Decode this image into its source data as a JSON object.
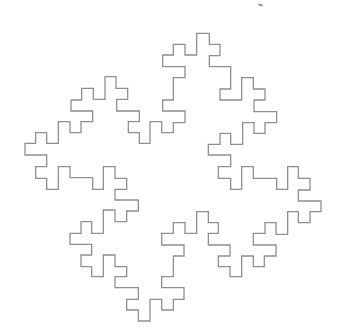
{
  "figure": {
    "stroke_color": "#8f8f8f",
    "stroke_width": 1.3,
    "background": "#ffffff",
    "scale_divisor": 3,
    "points": [
      [
        592,
        100
      ],
      [
        628,
        100
      ],
      [
        628,
        133
      ],
      [
        660,
        133
      ],
      [
        660,
        167
      ],
      [
        628,
        167
      ],
      [
        628,
        200
      ],
      [
        692,
        200
      ],
      [
        692,
        267
      ],
      [
        660,
        267
      ],
      [
        660,
        300
      ],
      [
        725,
        300
      ],
      [
        725,
        233
      ],
      [
        760,
        233
      ],
      [
        760,
        267
      ],
      [
        795,
        267
      ],
      [
        795,
        300
      ],
      [
        762,
        300
      ],
      [
        762,
        335
      ],
      [
        830,
        335
      ],
      [
        830,
        368
      ],
      [
        795,
        368
      ],
      [
        795,
        400
      ],
      [
        762,
        400
      ],
      [
        762,
        368
      ],
      [
        728,
        368
      ],
      [
        728,
        433
      ],
      [
        692,
        433
      ],
      [
        692,
        400
      ],
      [
        660,
        400
      ],
      [
        660,
        433
      ],
      [
        625,
        433
      ],
      [
        625,
        465
      ],
      [
        692,
        465
      ],
      [
        692,
        500
      ],
      [
        655,
        500
      ],
      [
        655,
        535
      ],
      [
        692,
        535
      ],
      [
        692,
        568
      ],
      [
        725,
        568
      ],
      [
        725,
        500
      ],
      [
        760,
        500
      ],
      [
        760,
        535
      ],
      [
        830,
        535
      ],
      [
        830,
        568
      ],
      [
        863,
        568
      ],
      [
        863,
        500
      ],
      [
        895,
        500
      ],
      [
        895,
        535
      ],
      [
        930,
        535
      ],
      [
        930,
        570
      ],
      [
        895,
        570
      ],
      [
        895,
        603
      ],
      [
        963,
        603
      ],
      [
        963,
        635
      ],
      [
        930,
        635
      ],
      [
        930,
        668
      ],
      [
        895,
        668
      ],
      [
        895,
        635
      ],
      [
        863,
        635
      ],
      [
        863,
        703
      ],
      [
        828,
        703
      ],
      [
        828,
        668
      ],
      [
        795,
        668
      ],
      [
        795,
        700
      ],
      [
        760,
        700
      ],
      [
        760,
        735
      ],
      [
        828,
        735
      ],
      [
        828,
        768
      ],
      [
        793,
        768
      ],
      [
        793,
        800
      ],
      [
        760,
        800
      ],
      [
        760,
        768
      ],
      [
        725,
        768
      ],
      [
        725,
        830
      ],
      [
        690,
        830
      ],
      [
        690,
        800
      ],
      [
        655,
        800
      ],
      [
        655,
        768
      ],
      [
        690,
        768
      ],
      [
        690,
        735
      ],
      [
        625,
        735
      ],
      [
        625,
        700
      ],
      [
        655,
        700
      ],
      [
        655,
        668
      ],
      [
        625,
        668
      ],
      [
        625,
        635
      ],
      [
        590,
        635
      ],
      [
        590,
        700
      ],
      [
        555,
        700
      ],
      [
        555,
        668
      ],
      [
        520,
        668
      ],
      [
        520,
        700
      ],
      [
        485,
        700
      ],
      [
        485,
        735
      ],
      [
        552,
        735
      ],
      [
        552,
        768
      ],
      [
        520,
        768
      ],
      [
        520,
        830
      ],
      [
        485,
        830
      ],
      [
        485,
        863
      ],
      [
        552,
        863
      ],
      [
        552,
        898
      ],
      [
        520,
        898
      ],
      [
        520,
        930
      ],
      [
        485,
        930
      ],
      [
        485,
        898
      ],
      [
        450,
        898
      ],
      [
        450,
        963
      ],
      [
        415,
        963
      ],
      [
        415,
        930
      ],
      [
        380,
        930
      ],
      [
        380,
        898
      ],
      [
        415,
        898
      ],
      [
        415,
        863
      ],
      [
        345,
        863
      ],
      [
        345,
        830
      ],
      [
        380,
        830
      ],
      [
        380,
        800
      ],
      [
        345,
        800
      ],
      [
        345,
        765
      ],
      [
        310,
        765
      ],
      [
        310,
        830
      ],
      [
        275,
        830
      ],
      [
        275,
        800
      ],
      [
        243,
        800
      ],
      [
        243,
        765
      ],
      [
        275,
        765
      ],
      [
        275,
        733
      ],
      [
        210,
        733
      ],
      [
        210,
        700
      ],
      [
        243,
        700
      ],
      [
        243,
        665
      ],
      [
        275,
        665
      ],
      [
        275,
        700
      ],
      [
        310,
        700
      ],
      [
        310,
        630
      ],
      [
        345,
        630
      ],
      [
        345,
        665
      ],
      [
        380,
        665
      ],
      [
        380,
        633
      ],
      [
        415,
        633
      ],
      [
        415,
        600
      ],
      [
        345,
        600
      ],
      [
        345,
        568
      ],
      [
        380,
        568
      ],
      [
        380,
        535
      ],
      [
        345,
        535
      ],
      [
        345,
        500
      ],
      [
        310,
        500
      ],
      [
        310,
        568
      ],
      [
        278,
        568
      ],
      [
        278,
        533
      ],
      [
        210,
        533
      ],
      [
        210,
        500
      ],
      [
        175,
        500
      ],
      [
        175,
        568
      ],
      [
        140,
        568
      ],
      [
        140,
        535
      ],
      [
        107,
        535
      ],
      [
        107,
        500
      ],
      [
        140,
        500
      ],
      [
        140,
        465
      ],
      [
        75,
        465
      ],
      [
        75,
        430
      ],
      [
        107,
        430
      ],
      [
        107,
        398
      ],
      [
        140,
        398
      ],
      [
        140,
        430
      ],
      [
        175,
        430
      ],
      [
        175,
        365
      ],
      [
        210,
        365
      ],
      [
        210,
        398
      ],
      [
        243,
        398
      ],
      [
        243,
        365
      ],
      [
        278,
        365
      ],
      [
        278,
        333
      ],
      [
        213,
        333
      ],
      [
        213,
        300
      ],
      [
        245,
        300
      ],
      [
        245,
        265
      ],
      [
        280,
        265
      ],
      [
        280,
        298
      ],
      [
        315,
        298
      ],
      [
        315,
        230
      ],
      [
        348,
        230
      ],
      [
        348,
        265
      ],
      [
        383,
        265
      ],
      [
        383,
        298
      ],
      [
        350,
        298
      ],
      [
        350,
        333
      ],
      [
        418,
        333
      ],
      [
        418,
        365
      ],
      [
        385,
        365
      ],
      [
        385,
        398
      ],
      [
        418,
        398
      ],
      [
        418,
        430
      ],
      [
        450,
        430
      ],
      [
        450,
        365
      ],
      [
        485,
        365
      ],
      [
        485,
        398
      ],
      [
        520,
        398
      ],
      [
        520,
        368
      ],
      [
        555,
        368
      ],
      [
        555,
        333
      ],
      [
        488,
        333
      ],
      [
        488,
        300
      ],
      [
        520,
        300
      ],
      [
        520,
        233
      ],
      [
        555,
        233
      ],
      [
        555,
        200
      ],
      [
        488,
        200
      ],
      [
        488,
        165
      ],
      [
        520,
        165
      ],
      [
        520,
        133
      ],
      [
        555,
        133
      ],
      [
        555,
        165
      ],
      [
        590,
        165
      ],
      [
        590,
        100
      ]
    ]
  }
}
